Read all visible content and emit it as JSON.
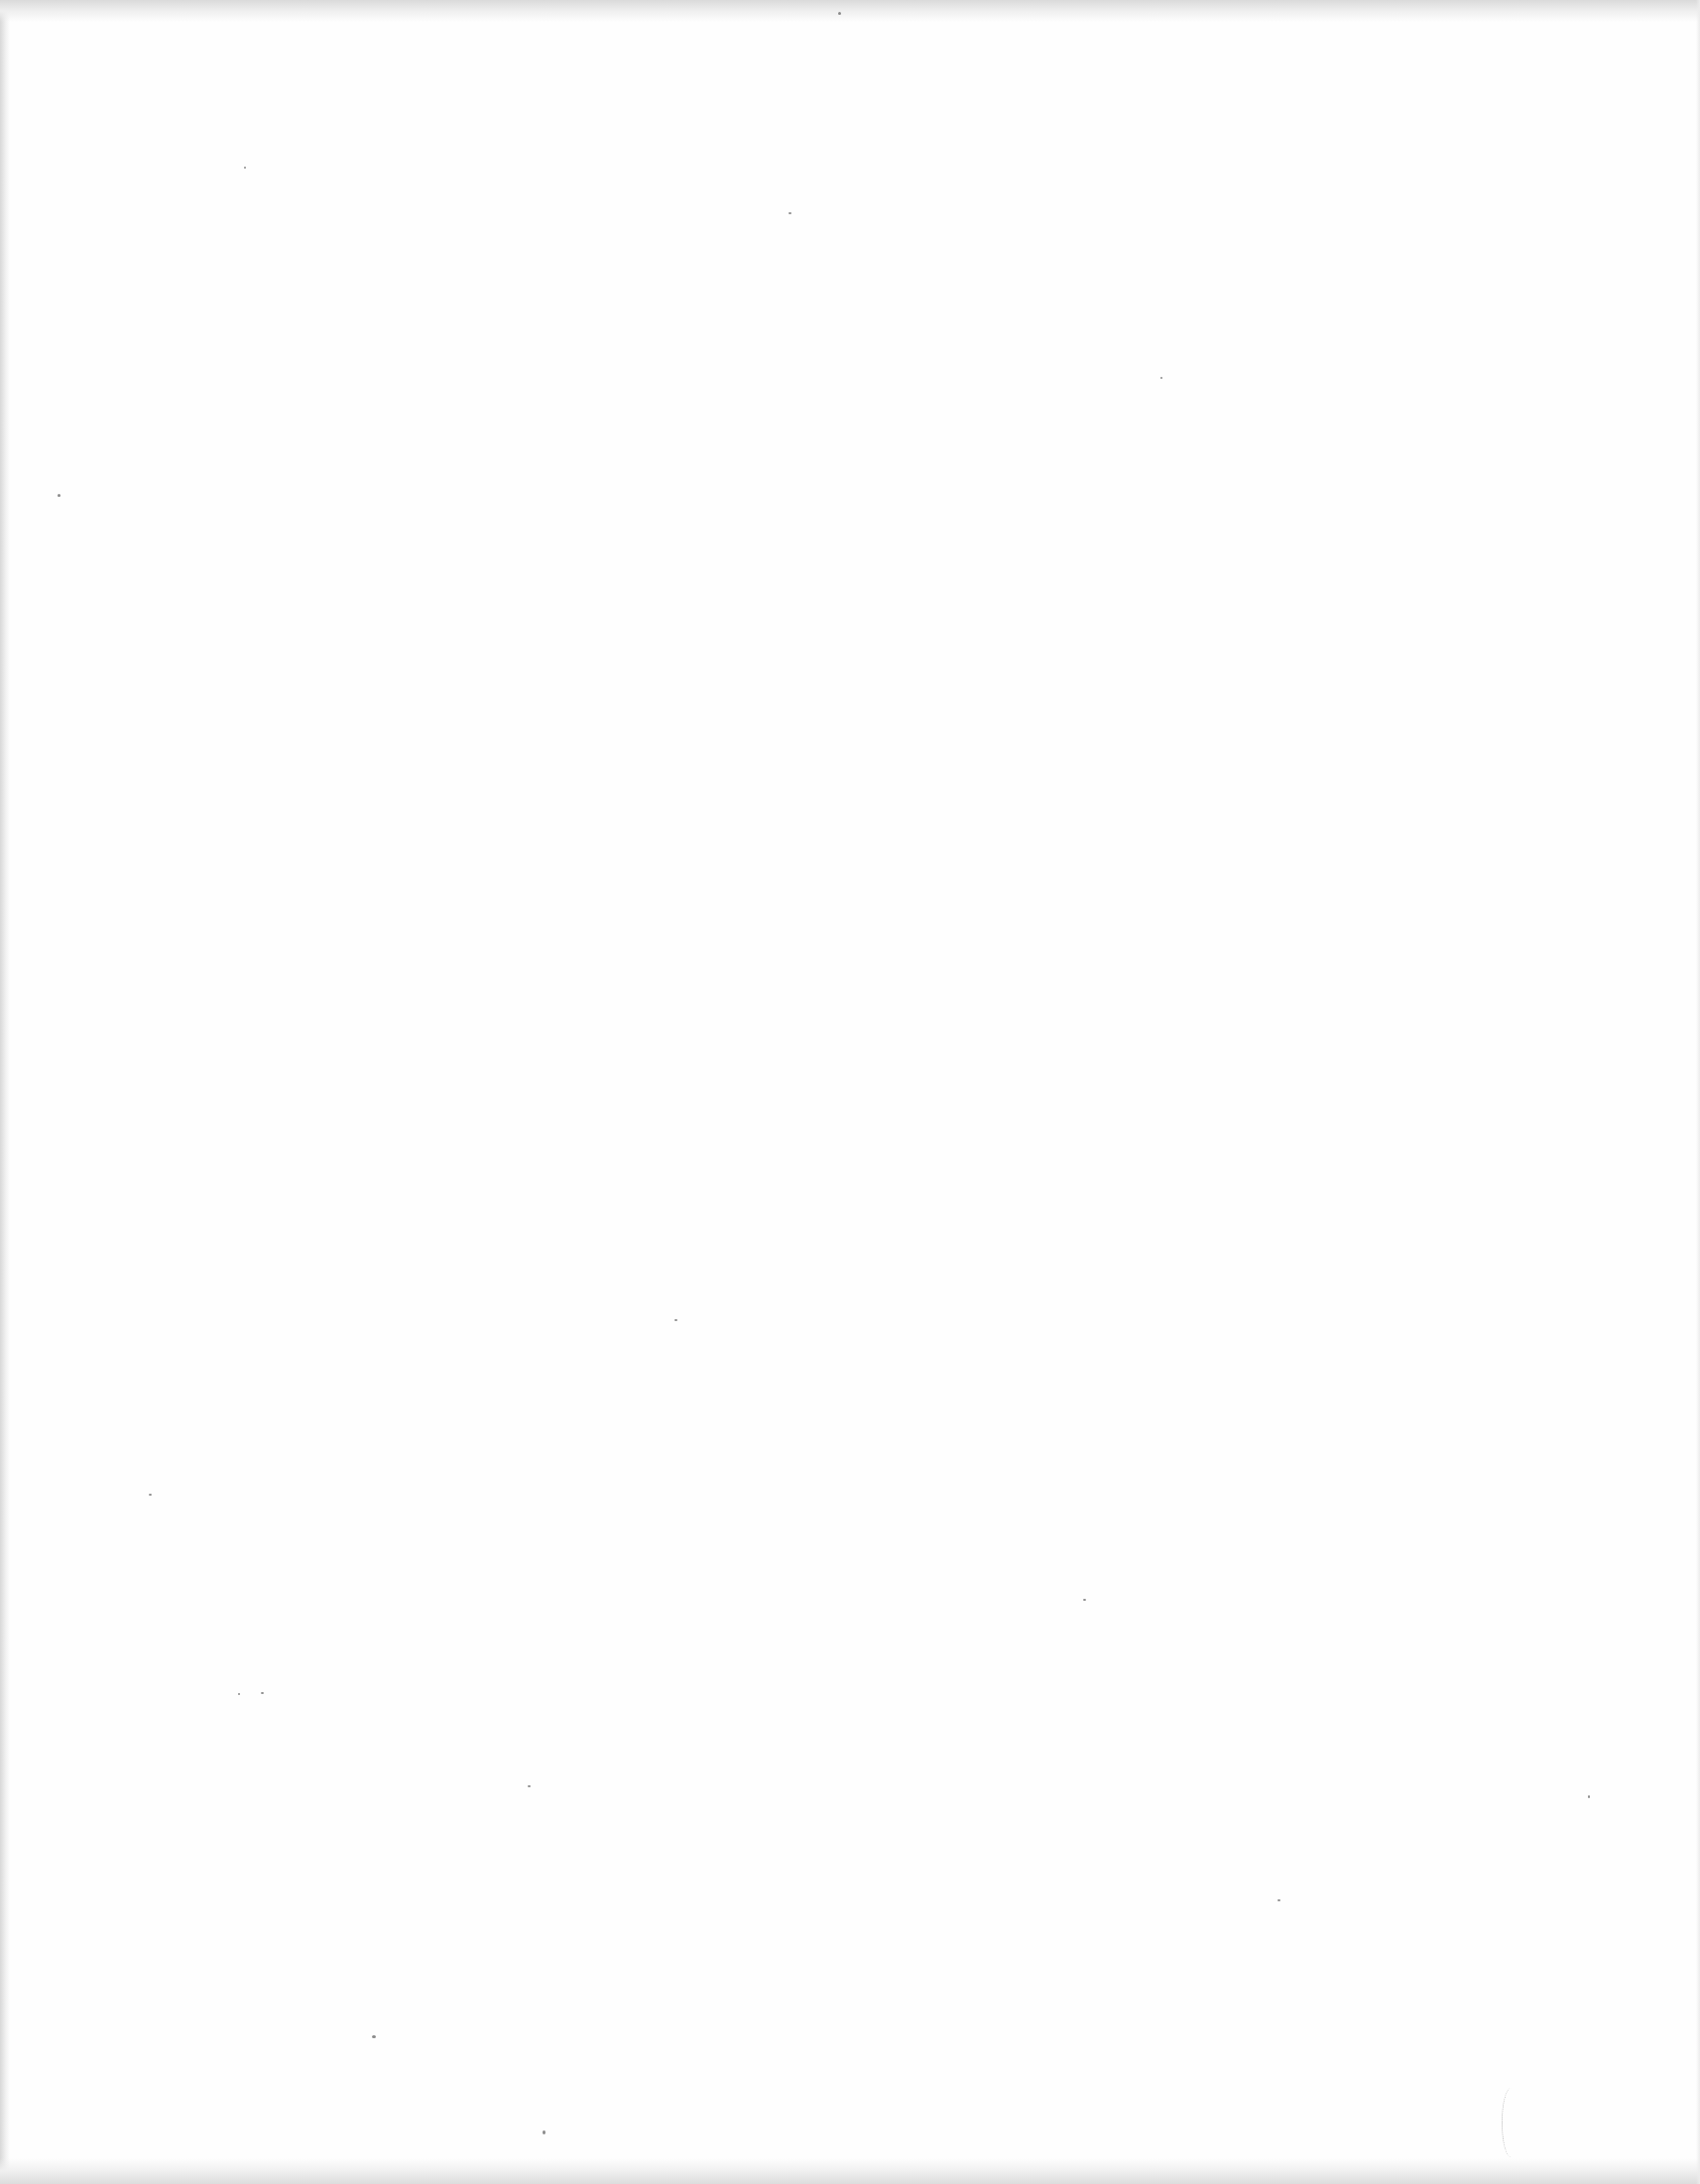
{
  "document": {
    "type": "scanned-page",
    "content": "",
    "is_blank": true,
    "background_color": "#fefefe",
    "edge_shadow_color": "#d8d8d8"
  },
  "specks": [
    {
      "x": 58,
      "y": 498,
      "w": 3,
      "h": 3
    },
    {
      "x": 246,
      "y": 168,
      "w": 2,
      "h": 2
    },
    {
      "x": 795,
      "y": 214,
      "w": 3,
      "h": 2
    },
    {
      "x": 263,
      "y": 1706,
      "w": 3,
      "h": 2
    },
    {
      "x": 150,
      "y": 1506,
      "w": 3,
      "h": 2
    },
    {
      "x": 240,
      "y": 1707,
      "w": 2,
      "h": 2
    },
    {
      "x": 532,
      "y": 1800,
      "w": 3,
      "h": 2
    },
    {
      "x": 375,
      "y": 2052,
      "w": 4,
      "h": 3
    },
    {
      "x": 547,
      "y": 2148,
      "w": 3,
      "h": 4
    },
    {
      "x": 680,
      "y": 1330,
      "w": 3,
      "h": 2
    },
    {
      "x": 1092,
      "y": 1612,
      "w": 3,
      "h": 2
    },
    {
      "x": 1288,
      "y": 1915,
      "w": 3,
      "h": 2
    },
    {
      "x": 845,
      "y": 12,
      "w": 3,
      "h": 3
    },
    {
      "x": 1601,
      "y": 1810,
      "w": 2,
      "h": 3
    },
    {
      "x": 1170,
      "y": 380,
      "w": 2,
      "h": 2
    }
  ]
}
